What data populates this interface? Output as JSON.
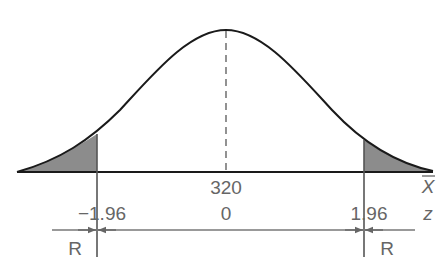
{
  "diagram": {
    "type": "normal-distribution-two-tailed-rejection",
    "center": {
      "x_value": "320",
      "z_value": "0"
    },
    "critical_values": {
      "left": "−1.96",
      "right": "1.96"
    },
    "axis_labels": {
      "sample_mean": "X",
      "z": "z"
    },
    "regions": {
      "left": "R",
      "right": "R"
    },
    "colors": {
      "curve": "#1a1a1a",
      "shade": "#8c8c8c",
      "text": "#666666",
      "guide": "#555555"
    }
  }
}
